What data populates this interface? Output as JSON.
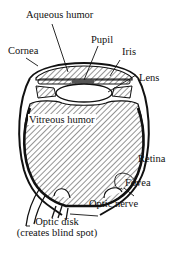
{
  "diagram": {
    "colors": {
      "ink": "#111111",
      "background": "#ffffff"
    },
    "labels": {
      "aqueous_humor": "Aqueous humor",
      "pupil": "Pupil",
      "cornea": "Cornea",
      "iris": "Iris",
      "lens": "Lens",
      "vitreous_humor": "Vitreous humor",
      "retina": "Retina",
      "fovea": "Fovea",
      "optic_nerve": "Optic nerve",
      "optic_disk": "Optic disk",
      "optic_disk_note": "(creates blind spot)"
    }
  }
}
